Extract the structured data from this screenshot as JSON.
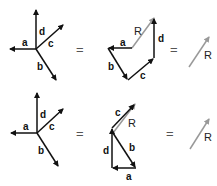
{
  "colors": {
    "vector": "#111111",
    "resultant": "#999999"
  },
  "symbols": {
    "equals": "="
  },
  "rows": [
    {
      "name": "row-1",
      "labels": {
        "a": "a",
        "b": "b",
        "c": "c",
        "d": "d",
        "R": "R"
      },
      "order": "a + b + c + d"
    },
    {
      "name": "row-2",
      "labels": {
        "a": "a",
        "b": "b",
        "c": "c",
        "d": "d",
        "R": "R"
      },
      "order": "b + a + d + c"
    }
  ]
}
